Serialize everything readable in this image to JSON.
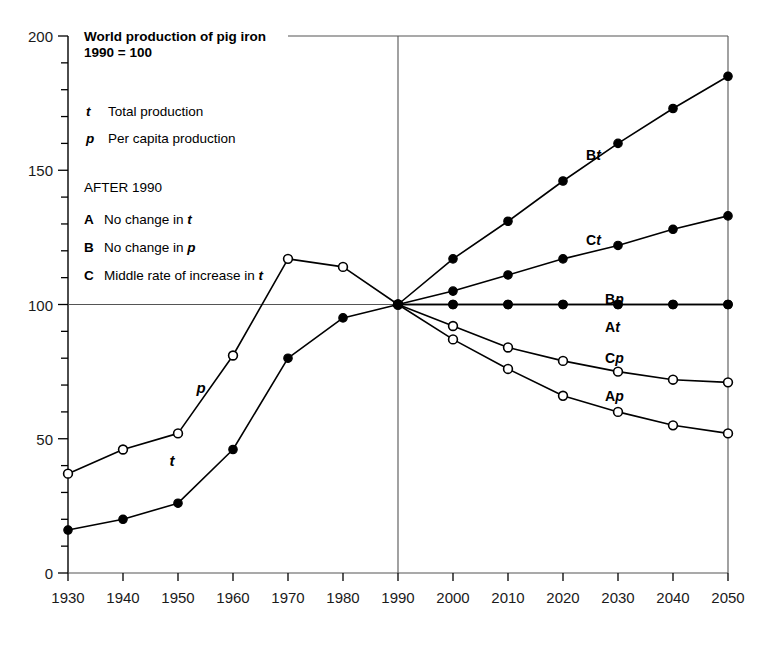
{
  "title": {
    "line1": "World production of pig iron",
    "line2": "1990 = 100"
  },
  "legend": {
    "entries": [
      {
        "symbol": "t",
        "label": "Total production"
      },
      {
        "symbol": "p",
        "label": "Per capita production"
      }
    ],
    "scenario_heading": "AFTER 1990",
    "scenarios": [
      {
        "symbol": "A",
        "label": "No change in ",
        "emphasis": "t"
      },
      {
        "symbol": "B",
        "label": "No change in ",
        "emphasis": "p"
      },
      {
        "symbol": "C",
        "label": "Middle rate of increase in ",
        "emphasis": "t"
      }
    ]
  },
  "inline_labels": [
    {
      "name": "p-curve-label",
      "text": "p",
      "x": 201,
      "y": 393
    },
    {
      "name": "t-curve-label",
      "text": "t",
      "x": 172,
      "y": 466
    }
  ],
  "curve_labels": [
    {
      "name": "Bt",
      "prefix": "B",
      "suffix": "t",
      "x": 586,
      "y": 160
    },
    {
      "name": "Ct",
      "prefix": "C",
      "suffix": "t",
      "x": 586,
      "y": 245
    },
    {
      "name": "Bp",
      "prefix": "B",
      "suffix": "p",
      "x": 605,
      "y": 304
    },
    {
      "name": "At",
      "prefix": "A",
      "suffix": "t",
      "x": 605,
      "y": 332
    },
    {
      "name": "Cp",
      "prefix": "C",
      "suffix": "p",
      "x": 605,
      "y": 363
    },
    {
      "name": "Ap",
      "prefix": "A",
      "suffix": "p",
      "x": 605,
      "y": 401
    }
  ],
  "chart_data": {
    "type": "line",
    "xlabel": "",
    "ylabel": "",
    "xlim": [
      1930,
      2050
    ],
    "ylim": [
      0,
      200
    ],
    "grid": false,
    "legend_position": "inside-plot",
    "y_major_ticks": [
      0,
      50,
      100,
      150,
      200
    ],
    "y_minor_step": 10,
    "x_ticks": [
      1930,
      1940,
      1950,
      1960,
      1970,
      1980,
      1990,
      2000,
      2010,
      2020,
      2030,
      2040,
      2050
    ],
    "x_tick_labels": [
      "1930",
      "1940",
      "1950",
      "1960",
      "1970",
      "1980",
      "1990",
      "2000",
      "2010",
      "2020",
      "2030",
      "2040",
      "2050"
    ],
    "reference_lines": [
      {
        "axis": "y",
        "value": 100
      },
      {
        "axis": "y",
        "value": 200
      },
      {
        "axis": "x",
        "value": 1990
      }
    ],
    "series": [
      {
        "name": "t",
        "description": "Total production, historical",
        "marker": "filled-circle",
        "x": [
          1930,
          1940,
          1950,
          1960,
          1970,
          1980,
          1990
        ],
        "values": [
          16,
          20,
          26,
          46,
          80,
          95,
          100
        ]
      },
      {
        "name": "p",
        "description": "Per capita production, historical",
        "marker": "open-circle",
        "x": [
          1930,
          1940,
          1950,
          1960,
          1970,
          1980,
          1990
        ],
        "values": [
          37,
          46,
          52,
          81,
          117,
          114,
          100
        ]
      },
      {
        "name": "Bt",
        "description": "Scenario B, total production",
        "marker": "filled-circle",
        "x": [
          1990,
          2000,
          2010,
          2020,
          2030,
          2040,
          2050
        ],
        "values": [
          100,
          117,
          131,
          146,
          160,
          173,
          185
        ]
      },
      {
        "name": "Ct",
        "description": "Scenario C, total production",
        "marker": "filled-circle",
        "x": [
          1990,
          2000,
          2010,
          2020,
          2030,
          2040,
          2050
        ],
        "values": [
          100,
          105,
          111,
          117,
          122,
          128,
          133
        ]
      },
      {
        "name": "At",
        "description": "Scenario A, total production",
        "marker": "filled-circle",
        "x": [
          1990,
          2000,
          2010,
          2020,
          2030,
          2040,
          2050
        ],
        "values": [
          100,
          100,
          100,
          100,
          100,
          100,
          100
        ]
      },
      {
        "name": "Bp",
        "description": "Scenario B, per capita production",
        "marker": "filled-circle",
        "x": [
          1990,
          2000,
          2010,
          2020,
          2030,
          2040,
          2050
        ],
        "values": [
          100,
          100,
          100,
          100,
          100,
          100,
          100
        ]
      },
      {
        "name": "Cp",
        "description": "Scenario C, per capita production",
        "marker": "open-circle",
        "x": [
          1990,
          2000,
          2010,
          2020,
          2030,
          2040,
          2050
        ],
        "values": [
          100,
          92,
          84,
          79,
          75,
          72,
          71
        ]
      },
      {
        "name": "Ap",
        "description": "Scenario A, per capita production",
        "marker": "open-circle",
        "x": [
          1990,
          2000,
          2010,
          2020,
          2030,
          2040,
          2050
        ],
        "values": [
          100,
          87,
          76,
          66,
          60,
          55,
          52
        ]
      }
    ]
  }
}
